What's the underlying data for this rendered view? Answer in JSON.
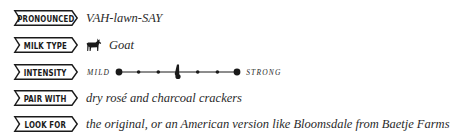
{
  "rows": [
    {
      "label": "Pronounced",
      "value": "VAH-lawn-SAY"
    },
    {
      "label": "Milk Type",
      "value": "Goat",
      "icon": "goat-icon"
    },
    {
      "label": "Intensity",
      "scale": {
        "min_label": "MILD",
        "max_label": "STRONG",
        "steps": 7,
        "marker_position": 4
      }
    },
    {
      "label": "Pair With",
      "value": "dry rosé and charcoal crackers"
    },
    {
      "label": "Look For",
      "value": "the original, or an American version like Bloomsdale from Baetje Farms"
    }
  ],
  "colors": {
    "ink": "#1a1a1a",
    "background": "#ffffff"
  }
}
